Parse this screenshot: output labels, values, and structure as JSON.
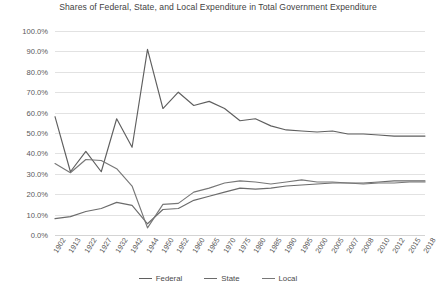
{
  "chart_data": {
    "type": "line",
    "title": "Shares of Federal, State, and Local Expenditure in Total Government Expenditure",
    "xlabel": "",
    "ylabel": "",
    "ylim": [
      0,
      100
    ],
    "yticks": [
      "0.0%",
      "10.0%",
      "20.0%",
      "30.0%",
      "40.0%",
      "50.0%",
      "60.0%",
      "70.0%",
      "80.0%",
      "90.0%",
      "100.0%"
    ],
    "ytick_values": [
      0,
      10,
      20,
      30,
      40,
      50,
      60,
      70,
      80,
      90,
      100
    ],
    "grid": true,
    "legend_position": "bottom",
    "categories": [
      "1902",
      "1913",
      "1922",
      "1927",
      "1932",
      "1942",
      "1944",
      "1950",
      "1952",
      "1960",
      "1965",
      "1970",
      "1975",
      "1980",
      "1985",
      "1990",
      "1995",
      "2000",
      "2005",
      "2007",
      "2008",
      "2010",
      "2012",
      "2015",
      "2018"
    ],
    "series": [
      {
        "name": "Federal",
        "color": "#5f5f5f",
        "values": [
          58.0,
          31.0,
          41.0,
          31.0,
          57.0,
          43.0,
          91.0,
          62.0,
          70.0,
          63.5,
          65.5,
          62.0,
          56.0,
          57.0,
          53.5,
          51.5,
          51.0,
          50.5,
          51.0,
          49.5,
          49.5,
          49.0,
          48.5,
          48.5,
          48.5
        ]
      },
      {
        "name": "State",
        "color": "#6b6b6b",
        "values": [
          8.0,
          9.0,
          11.5,
          13.0,
          16.0,
          14.5,
          5.5,
          12.5,
          13.0,
          17.0,
          19.0,
          21.0,
          23.0,
          22.5,
          23.0,
          24.0,
          24.5,
          25.0,
          25.5,
          25.5,
          25.5,
          26.0,
          26.5,
          26.5,
          26.5
        ]
      },
      {
        "name": "Local",
        "color": "#777777",
        "values": [
          35.0,
          30.5,
          37.0,
          36.5,
          32.5,
          24.0,
          3.5,
          15.0,
          15.5,
          21.0,
          23.0,
          25.5,
          26.5,
          26.0,
          25.0,
          26.0,
          27.0,
          26.0,
          26.0,
          25.5,
          25.0,
          25.5,
          25.5,
          26.0,
          26.0
        ]
      }
    ]
  },
  "legend": {
    "items": [
      {
        "label": "Federal"
      },
      {
        "label": "State"
      },
      {
        "label": "Local"
      }
    ]
  }
}
